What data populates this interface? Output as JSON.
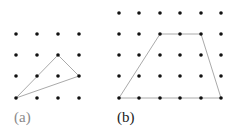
{
  "panels": [
    {
      "id": "a",
      "label": "(a)",
      "label_color": "#8a8a8a",
      "grid": {
        "cols": 4,
        "rows": 4,
        "x": [
          16,
          37,
          58,
          79
        ],
        "y": [
          34,
          55,
          76,
          98
        ]
      },
      "shape": "triangle",
      "polygon": [
        [
          16,
          98
        ],
        [
          58,
          55
        ],
        [
          79,
          76
        ]
      ]
    },
    {
      "id": "b",
      "label": "(b)",
      "label_color": "#222222",
      "grid": {
        "cols": 6,
        "rows": 5,
        "x": [
          119,
          139,
          160,
          180,
          201,
          221
        ],
        "y": [
          13,
          34,
          55,
          76,
          98
        ]
      },
      "shape": "trapezoid",
      "polygon": [
        [
          119,
          98
        ],
        [
          160,
          34
        ],
        [
          201,
          34
        ],
        [
          221,
          98
        ]
      ]
    }
  ],
  "colors": {
    "dot": "#111111",
    "line": "#aaaaaa",
    "background": "#ffffff"
  }
}
